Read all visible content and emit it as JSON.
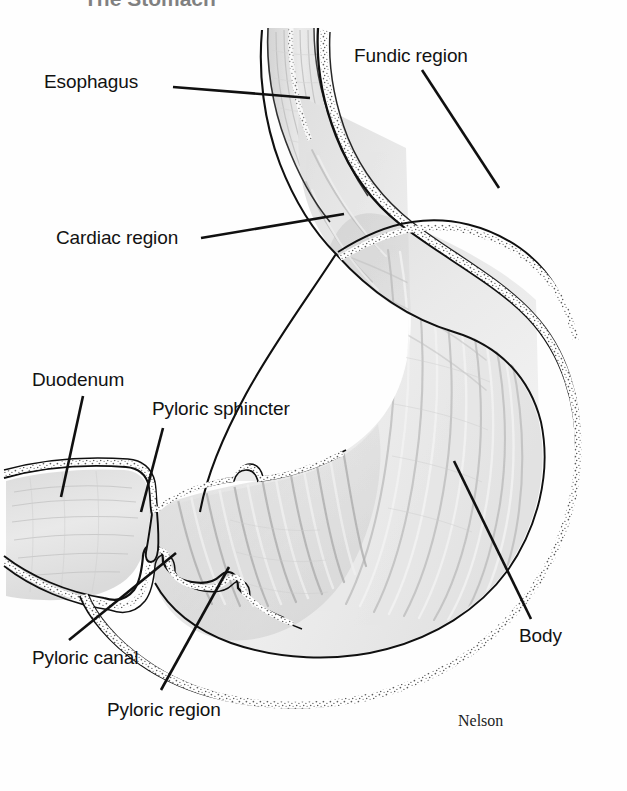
{
  "figure": {
    "kind": "anatomical-illustration",
    "background_color": "#fefefe",
    "line_color": "#101010",
    "cropped_title_fragment": "The Stomach",
    "signature": "Nelson"
  },
  "palette": {
    "outline": "#101010",
    "wall_fill": "#ffffff",
    "muscularis_stipple": "#6e6e6e",
    "mucosa_light": "#ececec",
    "mucosa_mid": "#dcdcdc",
    "mucosa_dark": "#c6c6c6",
    "rugae_shadow": "#b8b8b8",
    "duodenum_fill": "#e4e4e4",
    "esophagus_fill": "#e8e8e8"
  },
  "labels": [
    {
      "id": "esophagus",
      "text": "Esophagus",
      "x": 44,
      "y": 72,
      "leader": {
        "x1": 173,
        "y1": 87,
        "x2": 310,
        "y2": 98
      }
    },
    {
      "id": "fundic-region",
      "text": "Fundic region",
      "x": 354,
      "y": 46,
      "leader": {
        "x1": 422,
        "y1": 70,
        "x2": 499,
        "y2": 188
      }
    },
    {
      "id": "cardiac-region",
      "text": "Cardiac region",
      "x": 56,
      "y": 228,
      "leader": {
        "x1": 201,
        "y1": 238,
        "x2": 344,
        "y2": 214
      }
    },
    {
      "id": "duodenum",
      "text": "Duodenum",
      "x": 32,
      "y": 370,
      "leader": {
        "x1": 83,
        "y1": 396,
        "x2": 61,
        "y2": 497
      }
    },
    {
      "id": "pyloric-sphincter",
      "text": "Pyloric sphincter",
      "x": 152,
      "y": 399,
      "leader": {
        "x1": 163,
        "y1": 428,
        "x2": 141,
        "y2": 512
      }
    },
    {
      "id": "pyloric-canal",
      "text": "Pyloric canal",
      "x": 32,
      "y": 648,
      "leader": {
        "x1": 69,
        "y1": 640,
        "x2": 176,
        "y2": 553
      }
    },
    {
      "id": "pyloric-region",
      "text": "Pyloric region",
      "x": 107,
      "y": 700,
      "leader": {
        "x1": 161,
        "y1": 690,
        "x2": 229,
        "y2": 567
      }
    },
    {
      "id": "body",
      "text": "Body",
      "x": 519,
      "y": 626,
      "leader": {
        "x1": 531,
        "y1": 619,
        "x2": 454,
        "y2": 461
      }
    }
  ],
  "signature": {
    "text": "Nelson",
    "x": 458,
    "y": 713
  },
  "regions": [
    {
      "id": "esophagus",
      "name": "Esophagus"
    },
    {
      "id": "cardiac-region",
      "name": "Cardiac region"
    },
    {
      "id": "fundic-region",
      "name": "Fundic region"
    },
    {
      "id": "body",
      "name": "Body"
    },
    {
      "id": "pyloric-region",
      "name": "Pyloric region"
    },
    {
      "id": "pyloric-canal",
      "name": "Pyloric canal"
    },
    {
      "id": "pyloric-sphincter",
      "name": "Pyloric sphincter"
    },
    {
      "id": "duodenum",
      "name": "Duodenum"
    }
  ]
}
